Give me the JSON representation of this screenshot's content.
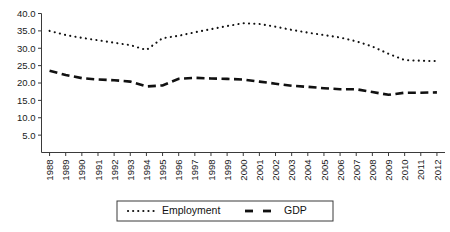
{
  "chart_data": {
    "type": "line",
    "title": "",
    "subtitle": "",
    "xlabel": "",
    "ylabel": "",
    "grid": false,
    "legend_position": "bottom",
    "categories": [
      "1988",
      "1989",
      "1990",
      "1991",
      "1992",
      "1993",
      "1994",
      "1995",
      "1996",
      "1997",
      "1998",
      "1999",
      "2000",
      "2001",
      "2002",
      "2003",
      "2004",
      "2005",
      "2006",
      "2007",
      "2008",
      "2009",
      "2010",
      "2011",
      "2012"
    ],
    "ylim": [
      0.0,
      40.0
    ],
    "yticks": [
      5.0,
      10.0,
      15.0,
      20.0,
      25.0,
      30.0,
      35.0,
      40.0
    ],
    "ytick_labels": [
      "5.0",
      "10.0",
      "15.0",
      "20.0",
      "25.0",
      "30.0",
      "35.0",
      "40.0"
    ],
    "series": [
      {
        "name": "Employment",
        "style": "dotted",
        "color": "#111111",
        "values": [
          35.0,
          33.8,
          33.0,
          32.3,
          31.6,
          30.9,
          29.5,
          32.9,
          33.6,
          34.6,
          35.5,
          36.4,
          37.2,
          37.0,
          36.2,
          35.3,
          34.5,
          33.8,
          33.1,
          32.0,
          30.5,
          28.4,
          26.6,
          26.4,
          26.3
        ]
      },
      {
        "name": "GDP",
        "style": "dashed",
        "color": "#111111",
        "values": [
          23.5,
          22.3,
          21.4,
          21.0,
          20.8,
          20.4,
          19.0,
          19.3,
          21.2,
          21.5,
          21.3,
          21.2,
          21.0,
          20.4,
          19.8,
          19.2,
          18.9,
          18.5,
          18.2,
          18.2,
          17.4,
          16.6,
          17.2,
          17.2,
          17.3
        ]
      }
    ]
  },
  "legend": {
    "entries": [
      {
        "label": "Employment"
      },
      {
        "label": "GDP"
      }
    ]
  }
}
